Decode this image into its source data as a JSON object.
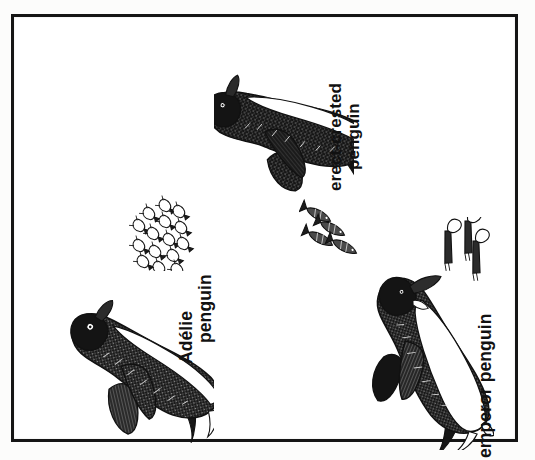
{
  "page": {
    "background_color": "#fcfcfb",
    "frame_color": "#151515",
    "ink_color": "#111111",
    "figure_background": "#ffffff"
  },
  "figures": [
    {
      "id": "erect-crested",
      "label_lines": [
        "erect-crested",
        "penguin"
      ],
      "species_label": "erect-crested penguin",
      "orientation": "rotated-90-ccw",
      "prey": {
        "name": "fish",
        "count": 4,
        "icon": "fish-school-icon"
      }
    },
    {
      "id": "adelie",
      "label_lines": [
        "Adélie",
        "penguin"
      ],
      "species_label": "Adélie penguin",
      "orientation": "rotated-90-ccw",
      "prey": {
        "name": "krill",
        "count": 15,
        "icon": "krill-cluster-icon"
      }
    },
    {
      "id": "emperor",
      "label_lines": [
        "emperor penguin"
      ],
      "species_label": "emperor penguin",
      "orientation": "rotated-90-ccw",
      "prey": {
        "name": "squid",
        "count": 3,
        "icon": "squid-group-icon"
      }
    }
  ],
  "labels": {
    "erect_crested_line1": "erect-crested",
    "erect_crested_line2": "penguin",
    "adelie_line1": "Adélie",
    "adelie_line2": "penguin",
    "emperor_line1": "emperor penguin"
  }
}
